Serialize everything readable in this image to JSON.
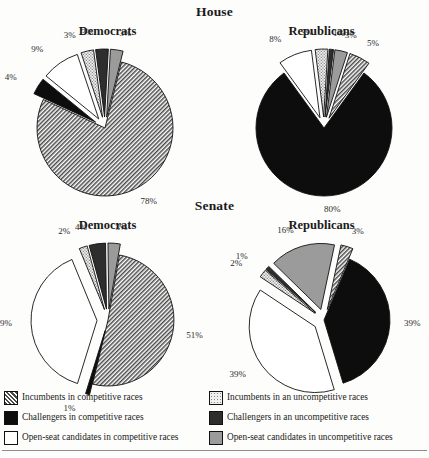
{
  "figure": {
    "background": "#fdfdfc",
    "sections": [
      {
        "name": "house",
        "title": "House"
      },
      {
        "name": "senate",
        "title": "Senate"
      }
    ],
    "legend": {
      "columns": [
        {
          "name": "competitive",
          "items": [
            {
              "swatch": "hatch-dark",
              "label": "Incumbents in competitive races"
            },
            {
              "swatch": "solid-black",
              "label": "Challengers in competitive races"
            },
            {
              "swatch": "white",
              "label": "Open-seat candidates in competitive races"
            }
          ]
        },
        {
          "name": "uncompetitive",
          "items": [
            {
              "swatch": "stipple-light",
              "label": "Incumbents in an uncompetitive races"
            },
            {
              "swatch": "dark-gray",
              "label": "Challengers in an uncompetitive races"
            },
            {
              "swatch": "mid-gray",
              "label": "Open-seat candidates in uncompetitive races"
            }
          ]
        }
      ]
    }
  },
  "colors": {
    "solid_black": "#0d0d0d",
    "dark_gray": "#2e2e2e",
    "mid_gray": "#9b9b9b",
    "white": "#ffffff",
    "outline": "#111111",
    "rule": "#8d8d8d",
    "text": "#1a1a1a"
  },
  "chart_data": [
    {
      "type": "pie",
      "name": "house-democrats",
      "title": "Democrats",
      "section": "House",
      "categories": [
        "Incumbents in competitive races",
        "Challengers in competitive races",
        "Open-seat candidates in competitive races",
        "Incumbents in an uncompetitive races",
        "Challengers in an uncompetitive races",
        "Open-seat candidates in uncompetitive races"
      ],
      "values": [
        78,
        4,
        9,
        3,
        3,
        3
      ],
      "labels": [
        "78%",
        "4%",
        "9%",
        "3%",
        "3%",
        "3%"
      ],
      "fills": [
        "hatch-dark",
        "solid-black",
        "white",
        "stipple-light",
        "dark-gray",
        "mid-gray"
      ],
      "exploded": [
        false,
        true,
        true,
        true,
        true,
        true
      ]
    },
    {
      "type": "pie",
      "name": "house-republicans",
      "title": "Republicans",
      "section": "House",
      "categories": [
        "Incumbents in competitive races",
        "Challengers in competitive races",
        "Open-seat candidates in competitive races",
        "Incumbents in an uncompetitive races",
        "Challengers in an uncompetitive races",
        "Open-seat candidates in uncompetitive races"
      ],
      "values": [
        5,
        80,
        8,
        3,
        1,
        3
      ],
      "labels": [
        "5%",
        "80%",
        "8%",
        "3%",
        "1%",
        "3%"
      ],
      "fills": [
        "hatch-dark",
        "solid-black",
        "white",
        "stipple-light",
        "dark-gray",
        "mid-gray"
      ],
      "exploded": [
        true,
        false,
        true,
        true,
        true,
        true
      ]
    },
    {
      "type": "pie",
      "name": "senate-democrats",
      "title": "Democrats",
      "section": "Senate",
      "categories": [
        "Incumbents in competitive races",
        "Challengers in competitive races",
        "Open-seat candidates in competitive races",
        "Incumbents in an uncompetitive races",
        "Challengers in an uncompetitive races",
        "Open-seat candidates in uncompetitive races"
      ],
      "values": [
        51,
        1,
        39,
        2,
        4,
        3
      ],
      "labels": [
        "51%",
        "1%",
        "39%",
        "2%",
        "4%",
        "3%"
      ],
      "fills": [
        "hatch-dark",
        "solid-black",
        "white",
        "stipple-light",
        "dark-gray",
        "mid-gray"
      ],
      "exploded": [
        false,
        true,
        true,
        true,
        true,
        true
      ]
    },
    {
      "type": "pie",
      "name": "senate-republicans",
      "title": "Republicans",
      "section": "Senate",
      "categories": [
        "Incumbents in competitive races",
        "Challengers in competitive races",
        "Open-seat candidates in competitive races",
        "Incumbents in an uncompetitive races",
        "Challengers in an uncompetitive races",
        "Open-seat candidates in uncompetitive races"
      ],
      "values": [
        3,
        39,
        39,
        2,
        1,
        16
      ],
      "labels": [
        "3%",
        "39%",
        "39%",
        "2%",
        "1%",
        "16%"
      ],
      "fills": [
        "hatch-dark",
        "solid-black",
        "white",
        "stipple-light",
        "dark-gray",
        "mid-gray"
      ],
      "exploded": [
        true,
        false,
        true,
        true,
        true,
        true
      ]
    }
  ]
}
